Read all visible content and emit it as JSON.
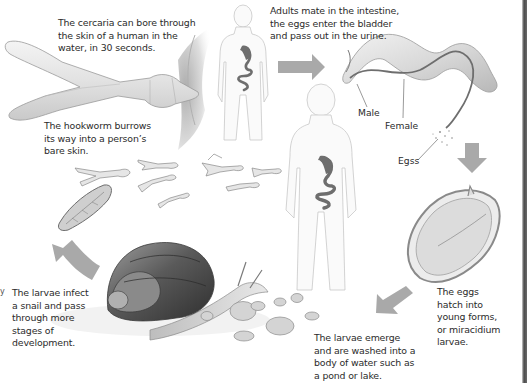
{
  "diagram": {
    "type": "life-cycle",
    "colors": {
      "background": "#ffffff",
      "arrow": "#a9a9a9",
      "text": "#2b2b2b",
      "organ": "#6e6e6e",
      "body_outline": "#c8c8c8",
      "right_border": "#4a4a4a"
    },
    "steps": [
      {
        "id": "cercaria",
        "text": "The cercaria can bore through the skin of a human in the water, in 30 seconds.",
        "lines": [
          "The cercaria can bore through",
          "the skin of a human in the",
          "water, in 30 seconds."
        ]
      },
      {
        "id": "adults",
        "text": "Adults mate in the intestine, the eggs enter the bladder and pass out in the urine.",
        "lines": [
          "Adults mate in the intestine,",
          "the eggs enter the bladder",
          "and pass out in the urine."
        ]
      },
      {
        "id": "hookworm",
        "text": "The hookworm burrows its way into a person's bare skin.",
        "lines": [
          "The hookworm burrows",
          "its way into a person’s",
          "bare skin."
        ]
      },
      {
        "id": "hatch",
        "text": "The eggs hatch into young forms, or miracidium larvae.",
        "lines": [
          "The eggs",
          "hatch into",
          "young forms,",
          "or miracidium",
          "larvae."
        ]
      },
      {
        "id": "emerge",
        "text": "The larvae emerge and are washed into a body of water such as a pond or lake.",
        "lines": [
          "The larvae emerge",
          "and are washed into a",
          "body of water such as",
          "a pond or lake."
        ]
      },
      {
        "id": "snail",
        "text": "The larvae infect a snail and pass through more stages of development.",
        "lines": [
          "The larvae infect",
          "a snail and pass",
          "through more",
          "stages of",
          "development."
        ]
      }
    ],
    "callouts": {
      "male": "Male",
      "female": "Female",
      "eggs": "Egss"
    },
    "edge_mark": "y",
    "arrows": [
      {
        "name": "arrow-right",
        "direction": "right"
      },
      {
        "name": "arrow-down",
        "direction": "down"
      },
      {
        "name": "arrow-down-left",
        "direction": "down-left"
      },
      {
        "name": "arrow-up-curved",
        "direction": "up"
      }
    ]
  }
}
